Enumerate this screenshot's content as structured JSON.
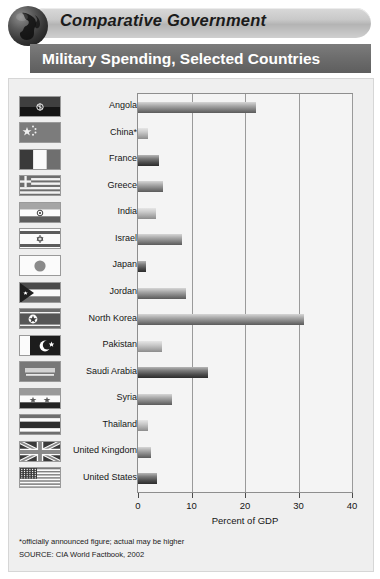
{
  "header": {
    "banner_title": "Comparative Government",
    "globe_icon": "globe-icon",
    "chart_title": "Military Spending, Selected Countries"
  },
  "footer": {
    "footnote": "*officially announced figure; actual may be higher",
    "source": "SOURCE: CIA World Factbook, 2002"
  },
  "chart_data": {
    "type": "bar",
    "orientation": "horizontal",
    "title": "Military Spending, Selected Countries",
    "xlabel": "Percent of GDP",
    "ylabel": "",
    "xlim": [
      0,
      40
    ],
    "xticks": [
      0,
      10,
      20,
      30,
      40
    ],
    "xticklabels": [
      "0",
      "10",
      "20",
      "30",
      "40"
    ],
    "grid": true,
    "legend": "none",
    "categories": [
      "Angola",
      "China*",
      "France",
      "Greece",
      "India",
      "Israel",
      "Japan",
      "Jordan",
      "North Korea",
      "Pakistan",
      "Saudi Arabia",
      "Syria",
      "Thailand",
      "United Kingdom",
      "United States"
    ],
    "values": [
      22.0,
      1.9,
      4.0,
      4.7,
      3.4,
      8.2,
      1.5,
      9.0,
      31.0,
      4.5,
      13.0,
      6.3,
      1.9,
      2.5,
      3.5
    ],
    "bars": [
      {
        "label": "Angola",
        "value": 22.0,
        "shade": "mid",
        "flag": "flag-angola"
      },
      {
        "label": "China*",
        "value": 1.9,
        "shade": "light",
        "flag": "flag-china"
      },
      {
        "label": "France",
        "value": 4.0,
        "shade": "dark",
        "flag": "flag-france"
      },
      {
        "label": "Greece",
        "value": 4.7,
        "shade": "mid",
        "flag": "flag-greece"
      },
      {
        "label": "India",
        "value": 3.4,
        "shade": "light",
        "flag": "flag-india"
      },
      {
        "label": "Israel",
        "value": 8.2,
        "shade": "mid",
        "flag": "flag-israel"
      },
      {
        "label": "Japan",
        "value": 1.5,
        "shade": "dark",
        "flag": "flag-japan"
      },
      {
        "label": "Jordan",
        "value": 9.0,
        "shade": "mid",
        "flag": "flag-jordan"
      },
      {
        "label": "North Korea",
        "value": 31.0,
        "shade": "mid",
        "flag": "flag-north-korea"
      },
      {
        "label": "Pakistan",
        "value": 4.5,
        "shade": "light",
        "flag": "flag-pakistan"
      },
      {
        "label": "Saudi Arabia",
        "value": 13.0,
        "shade": "dark",
        "flag": "flag-saudi-arabia"
      },
      {
        "label": "Syria",
        "value": 6.3,
        "shade": "mid",
        "flag": "flag-syria"
      },
      {
        "label": "Thailand",
        "value": 1.9,
        "shade": "light",
        "flag": "flag-thailand"
      },
      {
        "label": "United Kingdom",
        "value": 2.5,
        "shade": "mid",
        "flag": "flag-united-kingdom"
      },
      {
        "label": "United States",
        "value": 3.5,
        "shade": "dark",
        "flag": "flag-united-states"
      }
    ]
  },
  "colors": {
    "banner": "#c9c9c9",
    "titlebar": "#6c6c6c",
    "panel": "#efefef",
    "plot_bg": "#f4f4f4",
    "grid": "#9a9a9a",
    "text": "#151515",
    "title_text": "#ffffff"
  }
}
